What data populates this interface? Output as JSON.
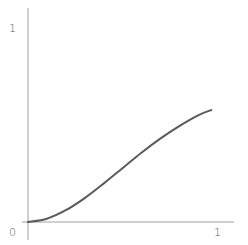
{
  "chart_data": {
    "type": "line",
    "title": "",
    "xlabel": "",
    "ylabel": "",
    "xlim": [
      0,
      1
    ],
    "ylim": [
      0,
      1
    ],
    "grid": false,
    "legend": null,
    "x_tick_labels": [
      "0",
      "1"
    ],
    "y_tick_labels": [
      "1"
    ],
    "origin_label": "0",
    "series": [
      {
        "name": "curve",
        "color": "#5a5a5a",
        "x": [
          0.0,
          0.1,
          0.2,
          0.3,
          0.4,
          0.5,
          0.6,
          0.7,
          0.8,
          0.9,
          0.97
        ],
        "y": [
          0.0,
          0.017,
          0.061,
          0.124,
          0.199,
          0.279,
          0.359,
          0.432,
          0.497,
          0.553,
          0.58
        ]
      }
    ]
  },
  "labels": {
    "origin": "0",
    "x_end": "1",
    "y_end": "1"
  },
  "colors": {
    "axis": "#9a9a9a",
    "curve": "#5a5a5a"
  }
}
